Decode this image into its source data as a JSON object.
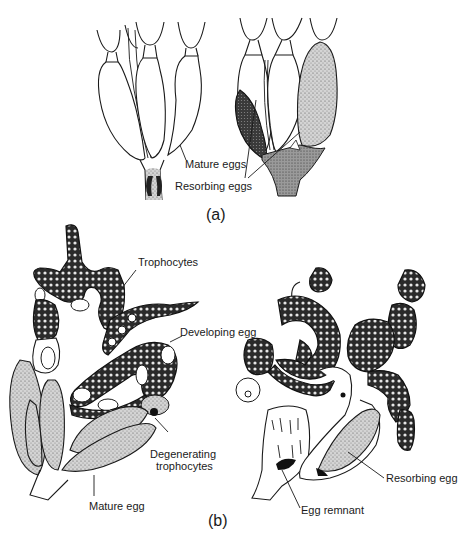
{
  "figure": {
    "panel_a": {
      "caption": "(a)",
      "labels": {
        "mature_eggs": "Mature eggs",
        "resorbing_eggs": "Resorbing eggs"
      }
    },
    "panel_b": {
      "caption": "(b)",
      "labels": {
        "trophocytes": "Trophocytes",
        "developing_egg": "Developing egg",
        "degenerating_trophocytes_line1": "Degenerating",
        "degenerating_trophocytes_line2": "trophocytes",
        "mature_egg": "Mature egg",
        "resorbing_egg": "Resorbing egg",
        "egg_remnant": "Egg remnant"
      }
    }
  }
}
